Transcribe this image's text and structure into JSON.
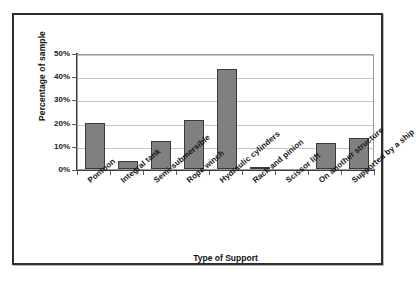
{
  "chart_data": {
    "type": "bar",
    "title": "",
    "xlabel": "Type of Support",
    "ylabel": "Percentage of sample",
    "categories": [
      "Pontoon",
      "Integral tank",
      "Semi-submersible",
      "Rope winch",
      "Hydraulic cylinders",
      "Rack and pinion",
      "Scissor lift",
      "On another structure",
      "Supported by a ship"
    ],
    "values": [
      20,
      3.5,
      12,
      21,
      43,
      1,
      0,
      11,
      13.5
    ],
    "ylim": [
      0,
      50
    ],
    "ytick_values": [
      0,
      10,
      20,
      30,
      40,
      50
    ],
    "ytick_labels": [
      "0%",
      "10%",
      "20%",
      "30%",
      "40%",
      "50%"
    ],
    "grid": "horizontal",
    "legend": "none",
    "bar_color": "#808080",
    "bar_border_color": "#3a3a3a",
    "gridline_color": "#c6c6c6",
    "axis_color": "#3a3a3a",
    "frame_color": "#2e2e2e",
    "background_color": "#ffffff"
  }
}
